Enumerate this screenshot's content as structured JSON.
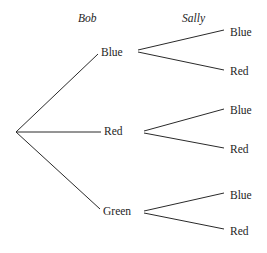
{
  "diagram": {
    "type": "probability-tree-diagram",
    "background_color": "#ffffff",
    "line_color": "#2a2a2a",
    "text_color": "#1e1e1e",
    "headers": [
      {
        "label": "Bob",
        "x": 78,
        "y": 13
      },
      {
        "label": "Sally",
        "x": 182,
        "y": 13
      }
    ],
    "root": {
      "x": 16,
      "y": 132
    },
    "level1": [
      {
        "label": "Blue",
        "text_x": 101,
        "text_y": 47,
        "node_x": 137,
        "node_y": 51,
        "line_end_x": 98,
        "line_end_y": 54
      },
      {
        "label": "Red",
        "text_x": 104,
        "text_y": 126,
        "node_x": 143,
        "node_y": 132,
        "line_end_x": 101,
        "line_end_y": 132
      },
      {
        "label": "Green",
        "text_x": 103,
        "text_y": 206,
        "node_x": 143,
        "node_y": 212,
        "line_end_x": 100,
        "line_end_y": 209
      }
    ],
    "level2": [
      {
        "parent": "Blue",
        "label": "Blue",
        "text_x": 230,
        "text_y": 27,
        "line_start_x": 141,
        "line_start_y": 50,
        "line_end_x": 224,
        "line_end_y": 30
      },
      {
        "parent": "Blue",
        "label": "Red",
        "text_x": 230,
        "text_y": 66,
        "line_start_x": 141,
        "line_start_y": 52,
        "line_end_x": 224,
        "line_end_y": 70
      },
      {
        "parent": "Red",
        "label": "Blue",
        "text_x": 230,
        "text_y": 105,
        "line_start_x": 147,
        "line_start_y": 131,
        "line_end_x": 224,
        "line_end_y": 109
      },
      {
        "parent": "Red",
        "label": "Red",
        "text_x": 230,
        "text_y": 144,
        "line_start_x": 147,
        "line_start_y": 133,
        "line_end_x": 224,
        "line_end_y": 148
      },
      {
        "parent": "Green",
        "label": "Blue",
        "text_x": 230,
        "text_y": 190,
        "line_start_x": 147,
        "line_start_y": 211,
        "line_end_x": 224,
        "line_end_y": 193
      },
      {
        "parent": "Green",
        "label": "Red",
        "text_x": 230,
        "text_y": 226,
        "line_start_x": 147,
        "line_start_y": 213,
        "line_end_x": 224,
        "line_end_y": 229
      }
    ]
  }
}
